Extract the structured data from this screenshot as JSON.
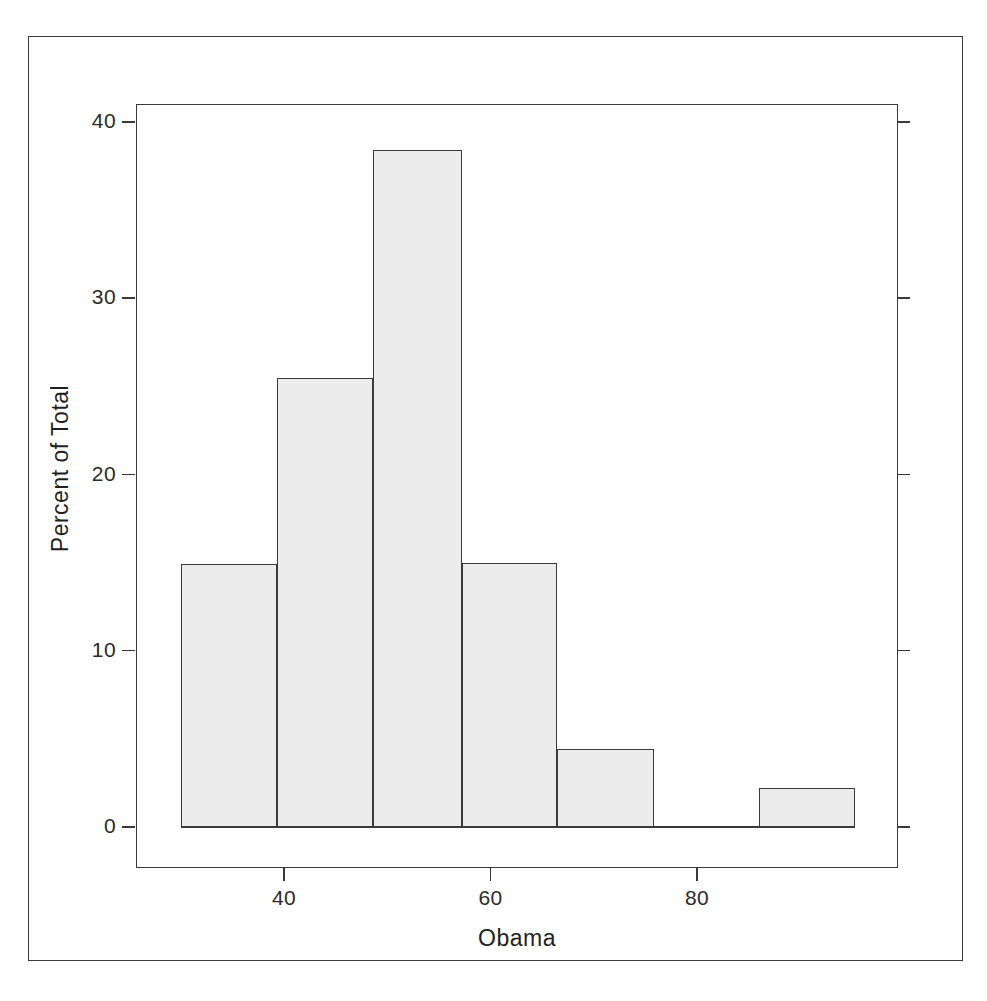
{
  "chart_data": {
    "type": "bar",
    "title": "",
    "subtitle": "",
    "xlabel": "Obama",
    "ylabel": "Percent of Total",
    "grid": false,
    "legend": null,
    "legend_position": "none",
    "xlim": [
      28,
      98
    ],
    "ylim": [
      0,
      41.2
    ],
    "xticks": [
      40,
      60,
      80
    ],
    "xtick_labels": [
      "40",
      "60",
      "80"
    ],
    "yticks": [
      0,
      10,
      20,
      30,
      40
    ],
    "ytick_labels": [
      "0",
      "10",
      "20",
      "30",
      "40"
    ],
    "bin_width": 9.3,
    "categories": [
      "30-39",
      "39-49",
      "49-58",
      "58-67",
      "67-77",
      "77-86",
      "86-95"
    ],
    "bin_edges": [
      30.0,
      39.3,
      48.6,
      57.2,
      66.4,
      75.8,
      86.0,
      95.3
    ],
    "values": [
      14.9,
      25.5,
      38.4,
      15.0,
      4.4,
      0.0,
      2.2
    ],
    "bars": [
      {
        "label": "bin-1",
        "x0": 30.0,
        "x1": 39.3,
        "value": 14.9
      },
      {
        "label": "bin-2",
        "x0": 39.3,
        "x1": 48.6,
        "value": 25.5
      },
      {
        "label": "bin-3",
        "x0": 48.6,
        "x1": 57.2,
        "value": 38.4
      },
      {
        "label": "bin-4",
        "x0": 57.2,
        "x1": 66.4,
        "value": 15.0
      },
      {
        "label": "bin-5",
        "x0": 66.4,
        "x1": 75.8,
        "value": 4.4
      },
      {
        "label": "bin-6",
        "x0": 75.8,
        "x1": 86.0,
        "value": 0.0
      },
      {
        "label": "bin-7",
        "x0": 86.0,
        "x1": 95.3,
        "value": 2.2
      }
    ],
    "colors": {
      "bar_fill": "#ececec",
      "bar_stroke": "#3a3a3a",
      "axis": "#3a3a3a",
      "text": "#1f1f1f",
      "background": "#ffffff"
    }
  },
  "axes": {
    "x_label": "Obama",
    "y_label": "Percent of Total",
    "x_tick_labels": [
      "40",
      "60",
      "80"
    ],
    "y_tick_labels": [
      "40",
      "30",
      "20",
      "10",
      "0"
    ]
  }
}
